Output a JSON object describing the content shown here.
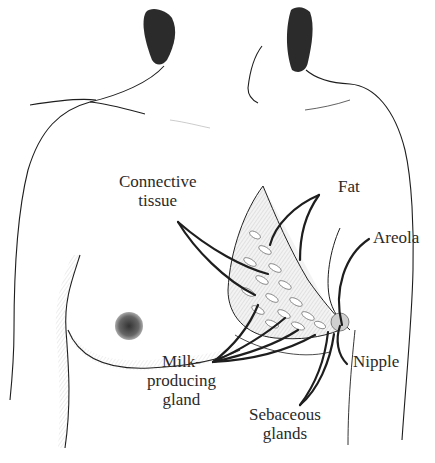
{
  "diagram": {
    "colors": {
      "ink": "#1e1e1e",
      "label_text": "#2a2a2a",
      "hair": "#2b2b2b",
      "background": "#ffffff"
    }
  },
  "labels": {
    "connective_tissue": {
      "line1": "Connective",
      "line2": "tissue"
    },
    "fat": "Fat",
    "areola": "Areola",
    "nipple": "Nipple",
    "milk_producing_gland": {
      "line1": "Milk-",
      "line2": "producing",
      "line3": "gland"
    },
    "sebaceous_glands": {
      "line1": "Sebaceous",
      "line2": "glands"
    }
  }
}
